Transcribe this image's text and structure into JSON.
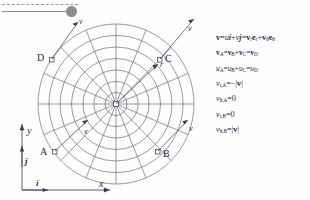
{
  "slider": {
    "name": "animation-slider",
    "value_position_pct": 89
  },
  "diagram": {
    "points": [
      {
        "id": "A",
        "label": "A",
        "vector_label": "v",
        "direction": "inward-up-right"
      },
      {
        "id": "B",
        "label": "B",
        "vector_label": "v",
        "direction": "outward-up-right"
      },
      {
        "id": "C",
        "label": "C",
        "vector_label": "v",
        "direction": "outward-up-right"
      },
      {
        "id": "D",
        "label": "D",
        "vector_label": "v",
        "direction": "outward-up-left"
      }
    ],
    "radius_label": "r",
    "axes": {
      "x_label": "x",
      "y_label": "y",
      "unit_i": "i",
      "unit_j": "j"
    },
    "grid": {
      "circles": 7,
      "spokes": 16
    }
  },
  "equations": {
    "lines": [
      {
        "id": "eq-velocity-decomposition",
        "html": "<span class=\"vv\">v</span>=<span class=\"it\">u</span><span class=\"vv it\">i</span>+<span class=\"it\">v</span><span class=\"vv it\">j</span>=<span class=\"vv\">v</span><sub>r</sub><span class=\"vv\">e</span><sub>r</sub>+<span class=\"vv\">v</span><sub>&#952;</sub><span class=\"vv\">e</span><sub>&#952;</sub>",
        "text": "v=ui+vj=v_r e_r + v_θ e_θ"
      },
      {
        "id": "eq-v-components",
        "html": "<span class=\"vv\">v</span><sub>A</sub>=<span class=\"vv\">v</span><sub>B</sub>+<span class=\"vv\">v</span><sub>C</sub>=<span class=\"vv\">v</span><sub>D</sub>",
        "text": "v_A=v_B+v_C=v_D"
      },
      {
        "id": "eq-u-components",
        "html": "<span class=\"it\">u</span><sub>A</sub>=<span class=\"it\">u</span><sub>B</sub>+<span class=\"it\">u</span><sub>C</sub>=<span class=\"it\">u</span><sub>D</sub>",
        "text": "u_A=u_B+u_C=u_D"
      },
      {
        "id": "eq-vr-A",
        "html": "<span class=\"it\">v</span><sub>r,A</sub>=&#8722;|<span class=\"vv\">v</span>|",
        "text": "v_r,A = -|v|"
      },
      {
        "id": "eq-vtheta-A",
        "html": "<span class=\"it\">v</span><sub>&#952;,A</sub>=0",
        "text": "v_θ,A = 0"
      },
      {
        "id": "eq-vr-B",
        "html": "<span class=\"it\">v</span><sub>r,B</sub>=0",
        "text": "v_r,B = 0"
      },
      {
        "id": "eq-vtheta-B",
        "html": "<span class=\"it\">v</span><sub>&#952;,B</sub>=|<span class=\"vv\">v</span>|",
        "text": "v_θ,B = |v|"
      }
    ]
  },
  "colors": {
    "ink": "#2a2a45",
    "grid": "#555566",
    "slider": "#8d8d8d",
    "background": "#fdfdfd"
  }
}
